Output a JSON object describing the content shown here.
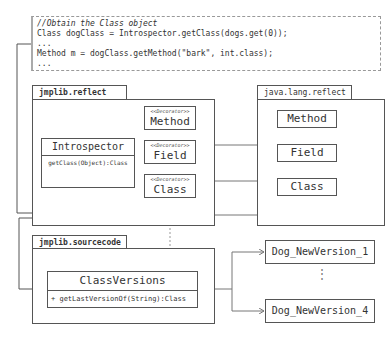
{
  "code_snippet": {
    "lines": [
      "//Obtain the Class object",
      "Class dogClass = Introspector.getClass(dogs.get(0));",
      "...",
      "Method m = dogClass.getMethod(\"bark\", int.class);",
      "..."
    ]
  },
  "packages": {
    "jmplib_reflect": {
      "name": "jmplib.reflect",
      "introspector": {
        "name": "Introspector",
        "method": "getClass(Object):Class"
      },
      "decorators": [
        {
          "stereotype": "<<Decorator>>",
          "name": "Method"
        },
        {
          "stereotype": "<<Decorator>>",
          "name": "Field"
        },
        {
          "stereotype": "<<Decorator>>",
          "name": "Class"
        }
      ]
    },
    "java_lang_reflect": {
      "name": "java.lang.reflect",
      "classes": [
        "Method",
        "Field",
        "Class"
      ]
    },
    "jmplib_sourcecode": {
      "name": "jmplib.sourcecode",
      "class_versions": {
        "name": "ClassVersions",
        "method": "+ getLastVersionOf(String):Class"
      }
    }
  },
  "versions": {
    "first": "Dog_NewVersion_1",
    "ellipsis": "⋮",
    "last": "Dog_NewVersion_4"
  }
}
